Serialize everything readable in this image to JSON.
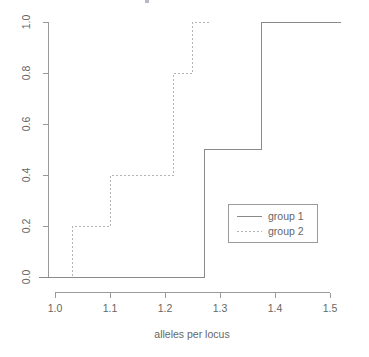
{
  "chart_data": {
    "type": "line",
    "subtype": "ecdf-step",
    "title": "",
    "xlabel": "alleles per locus",
    "ylabel": "",
    "xlim": [
      0.97,
      1.53
    ],
    "ylim": [
      -0.04,
      1.04
    ],
    "grid": false,
    "legend_position": "center-right",
    "xticks": [
      1.0,
      1.1,
      1.2,
      1.3,
      1.4,
      1.5
    ],
    "xtick_labels": [
      "1.0",
      "1.1",
      "1.2",
      "1.3",
      "1.4",
      "1.5"
    ],
    "yticks": [
      0.0,
      0.2,
      0.4,
      0.6,
      0.8,
      1.0
    ],
    "ytick_labels": [
      "0.0",
      "0.2",
      "0.4",
      "0.6",
      "0.8",
      "1.0"
    ],
    "series": [
      {
        "name": "group 1",
        "style": "solid",
        "color": "#8a8a8a",
        "x": [
          0.97,
          1.272,
          1.272,
          1.376,
          1.376,
          1.52
        ],
        "y": [
          0.0,
          0.0,
          0.5,
          0.5,
          1.0,
          1.0
        ],
        "jumps": [
          {
            "x": 1.272,
            "from": 0.0,
            "to": 0.5
          },
          {
            "x": 1.376,
            "from": 0.5,
            "to": 1.0
          }
        ]
      },
      {
        "name": "group 2",
        "style": "dotted",
        "color": "#b4b4b4",
        "x": [
          0.99,
          1.031,
          1.031,
          1.1,
          1.1,
          1.215,
          1.215,
          1.249,
          1.249,
          1.28
        ],
        "y": [
          0.0,
          0.0,
          0.2,
          0.2,
          0.4,
          0.4,
          0.8,
          0.8,
          1.0,
          1.0
        ],
        "jumps": [
          {
            "x": 1.031,
            "from": 0.0,
            "to": 0.2
          },
          {
            "x": 1.1,
            "from": 0.2,
            "to": 0.4
          },
          {
            "x": 1.215,
            "from": 0.4,
            "to": 0.8
          },
          {
            "x": 1.249,
            "from": 0.8,
            "to": 1.0
          }
        ]
      }
    ]
  },
  "axes": {
    "x": {
      "title": "alleles per locus",
      "ticks": [
        {
          "label": "1.0"
        },
        {
          "label": "1.1"
        },
        {
          "label": "1.2"
        },
        {
          "label": "1.3"
        },
        {
          "label": "1.4"
        },
        {
          "label": "1.5"
        }
      ]
    },
    "y": {
      "title": "",
      "ticks": [
        {
          "label": "0.0"
        },
        {
          "label": "0.2"
        },
        {
          "label": "0.4"
        },
        {
          "label": "0.6"
        },
        {
          "label": "0.8"
        },
        {
          "label": "1.0"
        }
      ]
    }
  },
  "legend": {
    "entries": [
      {
        "label": "group 1",
        "style": "solid"
      },
      {
        "label": "group 2",
        "style": "dotted"
      }
    ]
  }
}
